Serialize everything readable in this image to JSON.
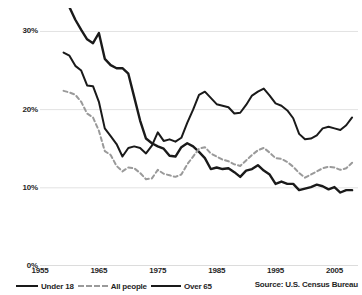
{
  "chart_data": {
    "type": "line",
    "title": "",
    "subtitle": "",
    "xlabel": "",
    "ylabel": "",
    "xlim": [
      1955,
      2009
    ],
    "ylim": [
      0,
      33
    ],
    "grid": true,
    "grid_axis": "y",
    "legend_position": "bottom-left",
    "xticks": [
      "1955",
      "1965",
      "1975",
      "1985",
      "1995",
      "2005"
    ],
    "xtick_values": [
      1955,
      1965,
      1975,
      1985,
      1995,
      2005
    ],
    "yticks": [
      "0%",
      "10%",
      "20%",
      "30%"
    ],
    "ytick_values": [
      0,
      10,
      20,
      30
    ],
    "source": "Source: U.S. Census Bureau",
    "series": [
      {
        "name": "Over 65",
        "style": "solid",
        "color": "#1a1a1a",
        "width": 2.4,
        "x": [
          1959,
          1960,
          1961,
          1962,
          1963,
          1964,
          1965,
          1966,
          1967,
          1968,
          1969,
          1970,
          1971,
          1972,
          1973,
          1974,
          1975,
          1976,
          1977,
          1978,
          1979,
          1980,
          1981,
          1982,
          1983,
          1984,
          1985,
          1986,
          1987,
          1988,
          1989,
          1990,
          1991,
          1992,
          1993,
          1994,
          1995,
          1996,
          1997,
          1998,
          1999,
          2000,
          2001,
          2002,
          2003,
          2004,
          2005,
          2006,
          2007,
          2008
        ],
        "y": [
          35.2,
          33.1,
          31.5,
          30.2,
          29.0,
          28.5,
          29.8,
          26.5,
          25.7,
          25.3,
          25.3,
          24.6,
          21.6,
          18.6,
          16.3,
          15.7,
          15.3,
          15.0,
          14.1,
          14.0,
          15.2,
          15.7,
          15.3,
          14.6,
          13.8,
          12.4,
          12.6,
          12.4,
          12.5,
          12.0,
          11.4,
          12.2,
          12.4,
          12.9,
          12.2,
          11.7,
          10.5,
          10.8,
          10.5,
          10.5,
          9.7,
          9.9,
          10.1,
          10.4,
          10.2,
          9.8,
          10.1,
          9.4,
          9.7,
          9.7
        ]
      },
      {
        "name": "All people",
        "style": "dashed",
        "color": "#9a9a9a",
        "width": 2.0,
        "x": [
          1959,
          1960,
          1961,
          1962,
          1963,
          1964,
          1965,
          1966,
          1967,
          1968,
          1969,
          1970,
          1971,
          1972,
          1973,
          1974,
          1975,
          1976,
          1977,
          1978,
          1979,
          1980,
          1981,
          1982,
          1983,
          1984,
          1985,
          1986,
          1987,
          1988,
          1989,
          1990,
          1991,
          1992,
          1993,
          1994,
          1995,
          1996,
          1997,
          1998,
          1999,
          2000,
          2001,
          2002,
          2003,
          2004,
          2005,
          2006,
          2007,
          2008
        ],
        "y": [
          22.4,
          22.2,
          21.9,
          21.0,
          19.5,
          19.0,
          17.3,
          14.7,
          14.2,
          12.8,
          12.1,
          12.6,
          12.5,
          11.9,
          11.1,
          11.2,
          12.3,
          11.8,
          11.6,
          11.4,
          11.7,
          13.0,
          14.0,
          15.0,
          15.2,
          14.4,
          14.0,
          13.6,
          13.4,
          13.0,
          12.8,
          13.5,
          14.2,
          14.8,
          15.1,
          14.5,
          13.8,
          13.7,
          13.3,
          12.7,
          11.9,
          11.3,
          11.7,
          12.1,
          12.5,
          12.7,
          12.6,
          12.3,
          12.5,
          13.2
        ]
      },
      {
        "name": "Under 18",
        "style": "solid",
        "color": "#1a1a1a",
        "width": 2.0,
        "x": [
          1959,
          1960,
          1961,
          1962,
          1963,
          1964,
          1965,
          1966,
          1967,
          1968,
          1969,
          1970,
          1971,
          1972,
          1973,
          1974,
          1975,
          1976,
          1977,
          1978,
          1979,
          1980,
          1981,
          1982,
          1983,
          1984,
          1985,
          1986,
          1987,
          1988,
          1989,
          1990,
          1991,
          1992,
          1993,
          1994,
          1995,
          1996,
          1997,
          1998,
          1999,
          2000,
          2001,
          2002,
          2003,
          2004,
          2005,
          2006,
          2007,
          2008
        ],
        "y": [
          27.3,
          26.9,
          25.6,
          25.0,
          23.1,
          23.0,
          21.0,
          17.6,
          16.6,
          15.6,
          14.0,
          15.1,
          15.3,
          15.1,
          14.4,
          15.4,
          17.1,
          16.0,
          16.2,
          15.9,
          16.4,
          18.3,
          20.0,
          21.9,
          22.3,
          21.5,
          20.7,
          20.5,
          20.3,
          19.5,
          19.6,
          20.6,
          21.8,
          22.3,
          22.7,
          21.8,
          20.8,
          20.5,
          19.9,
          18.9,
          16.9,
          16.2,
          16.3,
          16.7,
          17.6,
          17.8,
          17.6,
          17.4,
          18.0,
          19.0
        ]
      }
    ]
  },
  "legend": {
    "items": [
      {
        "label": "Under 18"
      },
      {
        "label": "All people"
      },
      {
        "label": "Over 65"
      }
    ]
  },
  "footer": {
    "source": "Source: U.S. Census Bureau"
  }
}
